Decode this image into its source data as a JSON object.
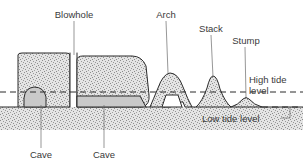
{
  "diagram": {
    "background_color": "#ffffff",
    "rock_fill_color": "#dcdcdc",
    "cave_fill_color": "#c9c9c9",
    "outline_color": "#2b2b2b",
    "text_color": "#3a3a3a",
    "leader_color": "#6a6a6a"
  },
  "labels": {
    "blowhole": "Blowhole",
    "arch": "Arch",
    "stack": "Stack",
    "stump": "Stump",
    "cave_left": "Cave",
    "cave_right": "Cave",
    "high_tide_line1": "High tide",
    "high_tide_line2": "level",
    "low_tide": "Low tide level"
  },
  "features": [
    {
      "name": "Blowhole",
      "position": "left-cliff-gap",
      "label_x": 74,
      "label_y": 16
    },
    {
      "name": "Arch",
      "position": "headland-opening",
      "label_x": 157,
      "label_y": 16
    },
    {
      "name": "Stack",
      "position": "isolated-pillar",
      "label_x": 207,
      "label_y": 30
    },
    {
      "name": "Stump",
      "position": "eroded-remnant",
      "label_x": 240,
      "label_y": 42
    },
    {
      "name": "Cave",
      "position": "left-cliff-base",
      "label_x": 35,
      "label_y": 158
    },
    {
      "name": "Cave",
      "position": "right-cliff-base",
      "label_x": 99,
      "label_y": 158
    }
  ],
  "tide_levels": {
    "high_tide_y": 92,
    "low_tide_y": 107
  }
}
